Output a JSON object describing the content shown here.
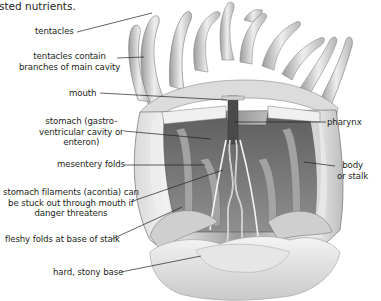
{
  "caption": "sted nutrients.",
  "diagram": {
    "labels": [
      {
        "id": "tentacles",
        "text": "tentacles"
      },
      {
        "id": "tentacles-branches",
        "lines": [
          "tentacles contain",
          "branches of main cavity"
        ]
      },
      {
        "id": "mouth",
        "text": "mouth"
      },
      {
        "id": "stomach",
        "lines": [
          "stomach (gastro-",
          "ventricular cavity or",
          "enteron)"
        ]
      },
      {
        "id": "mesentery",
        "text": "mesentery folds"
      },
      {
        "id": "filaments",
        "lines": [
          "stomach filaments (acontia) can",
          "be stuck out through mouth if",
          "danger threatens"
        ]
      },
      {
        "id": "fleshy-folds",
        "text": "fleshy folds at base of stalk"
      },
      {
        "id": "stony-base",
        "text": "hard, stony base"
      },
      {
        "id": "pharynx",
        "text": "pharynx"
      },
      {
        "id": "body",
        "lines": [
          "body",
          "or stalk"
        ]
      }
    ],
    "colors": {
      "label_text": "#231f20",
      "leader_line": "#231f20",
      "illustration_light": "#e6e6e6",
      "illustration_mid": "#b9b9b9",
      "illustration_dark": "#6e6e6e"
    }
  }
}
